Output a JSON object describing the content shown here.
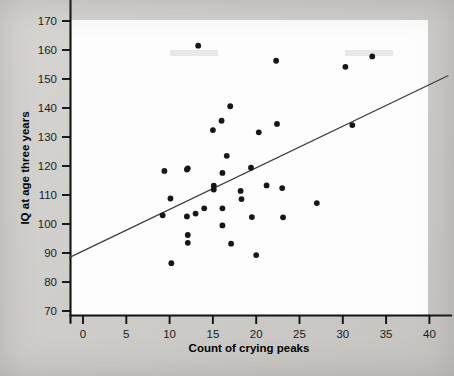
{
  "figure": {
    "background_color": "#cfcecb",
    "plot_background_color": "#fdfdfd",
    "point_color": "#161616",
    "line_color": "#3b3b3b"
  },
  "chart_data": {
    "type": "scatter",
    "title": "",
    "xlabel": "Count of crying peaks",
    "ylabel": "IQ at age three years",
    "xlim": [
      -1.8,
      42.5
    ],
    "ylim": [
      66,
      184
    ],
    "xticks": [
      0,
      5,
      10,
      15,
      20,
      25,
      30,
      35,
      40
    ],
    "yticks": [
      70,
      80,
      90,
      100,
      110,
      120,
      130,
      140,
      150,
      160,
      170,
      180
    ],
    "xtick_labels": [
      "0",
      "5",
      "10",
      "15",
      "20",
      "25",
      "30",
      "35",
      "40"
    ],
    "ytick_labels": [
      "70",
      "80",
      "90",
      "100",
      "110",
      "120",
      "130",
      "140",
      "150",
      "160",
      "170",
      "180"
    ],
    "grid": false,
    "legend": null,
    "series": [
      {
        "name": "Infants",
        "marker": "circle",
        "points": [
          [
            9.2,
            103.0
          ],
          [
            9.4,
            118.3
          ],
          [
            10.1,
            108.8
          ],
          [
            10.2,
            86.5
          ],
          [
            12.0,
            102.6
          ],
          [
            12.0,
            118.8
          ],
          [
            12.1,
            119.2
          ],
          [
            12.1,
            96.2
          ],
          [
            12.1,
            93.5
          ],
          [
            13.0,
            103.6
          ],
          [
            13.3,
            161.5
          ],
          [
            14.0,
            105.4
          ],
          [
            15.0,
            132.4
          ],
          [
            15.1,
            113.2
          ],
          [
            15.1,
            111.9
          ],
          [
            16.0,
            135.6
          ],
          [
            16.1,
            117.6
          ],
          [
            16.1,
            105.4
          ],
          [
            16.1,
            99.5
          ],
          [
            16.6,
            123.5
          ],
          [
            17.0,
            140.6
          ],
          [
            17.1,
            93.2
          ],
          [
            18.2,
            111.4
          ],
          [
            18.3,
            108.6
          ],
          [
            19.4,
            119.4
          ],
          [
            19.5,
            102.4
          ],
          [
            20.0,
            89.3
          ],
          [
            20.3,
            131.6
          ],
          [
            21.2,
            113.3
          ],
          [
            22.3,
            156.3
          ],
          [
            22.4,
            134.5
          ],
          [
            23.0,
            112.4
          ],
          [
            23.1,
            102.3
          ],
          [
            27.0,
            107.2
          ],
          [
            30.3,
            154.2
          ],
          [
            31.1,
            134.1
          ],
          [
            33.4,
            157.8
          ]
        ]
      }
    ],
    "fit_line": {
      "name": "least-squares regression line",
      "x_start": -1.6,
      "y_start": 88.4,
      "x_end": 42.2,
      "y_end": 151.2
    }
  }
}
